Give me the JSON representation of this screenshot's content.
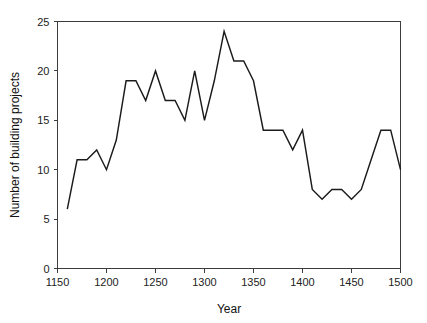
{
  "chart_data": {
    "type": "line",
    "title": "",
    "subtitle": "",
    "xlabel": "Year",
    "ylabel": "Number of building projects",
    "xlim": [
      1150,
      1500
    ],
    "ylim": [
      0,
      25
    ],
    "grid": false,
    "legend": null,
    "legend_position": "none",
    "x_ticks": [
      1150,
      1200,
      1250,
      1300,
      1350,
      1400,
      1450,
      1500
    ],
    "x_tick_labels": [
      "1150",
      "1200",
      "1250",
      "1300",
      "1350",
      "1400",
      "1450",
      "1500"
    ],
    "y_ticks": [
      0,
      5,
      10,
      15,
      20,
      25
    ],
    "y_tick_labels": [
      "0",
      "5",
      "10",
      "15",
      "20",
      "25"
    ],
    "line_color": "#1b1b1b",
    "x": [
      1160,
      1170,
      1180,
      1190,
      1200,
      1210,
      1220,
      1230,
      1240,
      1250,
      1260,
      1270,
      1280,
      1290,
      1300,
      1310,
      1320,
      1330,
      1340,
      1350,
      1360,
      1370,
      1380,
      1390,
      1400,
      1410,
      1420,
      1430,
      1440,
      1450,
      1460,
      1470,
      1480,
      1490,
      1500
    ],
    "values": [
      6,
      11,
      11,
      12,
      10,
      13,
      19,
      19,
      17,
      20,
      17,
      17,
      15,
      20,
      15,
      19,
      24,
      21,
      21,
      19,
      14,
      14,
      14,
      12,
      14,
      8,
      7,
      8,
      8,
      7,
      8,
      11,
      14,
      14,
      10
    ],
    "series": [
      {
        "name": "Number of building projects",
        "values": [
          6,
          11,
          11,
          12,
          10,
          13,
          19,
          19,
          17,
          20,
          17,
          17,
          15,
          20,
          15,
          19,
          24,
          21,
          21,
          19,
          14,
          14,
          14,
          12,
          14,
          8,
          7,
          8,
          8,
          7,
          8,
          11,
          14,
          14,
          10
        ]
      }
    ],
    "annotations": []
  }
}
